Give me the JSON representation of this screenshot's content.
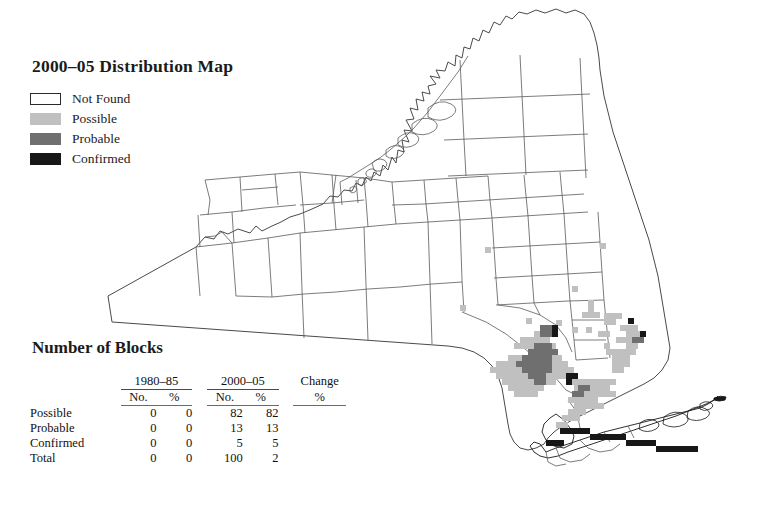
{
  "legend": {
    "title": "2000–05 Distribution Map",
    "items": [
      {
        "label": "Not Found",
        "swatch": "notfound",
        "color": "#ffffff"
      },
      {
        "label": "Possible",
        "swatch": "possible",
        "color": "#c0c0c0"
      },
      {
        "label": "Probable",
        "swatch": "probable",
        "color": "#6f6f6f"
      },
      {
        "label": "Confirmed",
        "swatch": "confirmed",
        "color": "#171717"
      }
    ]
  },
  "blocks": {
    "title": "Number of Blocks",
    "group_headers": [
      "1980–85",
      "2000–05",
      "Change"
    ],
    "sub_headers": [
      "No.",
      "%",
      "No.",
      "%",
      "%"
    ],
    "rows": [
      {
        "label": "Possible",
        "p1_no": "0",
        "p1_pct": "0",
        "p2_no": "82",
        "p2_pct": "82",
        "change_pct": ""
      },
      {
        "label": "Probable",
        "p1_no": "0",
        "p1_pct": "0",
        "p2_no": "13",
        "p2_pct": "13",
        "change_pct": ""
      },
      {
        "label": "Confirmed",
        "p1_no": "0",
        "p1_pct": "0",
        "p2_no": "5",
        "p2_pct": "5",
        "change_pct": ""
      },
      {
        "label": "Total",
        "p1_no": "0",
        "p1_pct": "0",
        "p2_no": "100",
        "p2_pct": "2",
        "change_pct": ""
      }
    ]
  },
  "map": {
    "region_name": "New York State county map",
    "outline_color": "#4a4a4a",
    "coast_color": "#1a1a1a",
    "block_size": 6,
    "blocks_possible": [
      [
        485,
        247
      ],
      [
        600,
        243
      ],
      [
        460,
        305
      ],
      [
        572,
        286
      ],
      [
        526,
        318
      ],
      [
        556,
        320
      ],
      [
        534,
        331
      ],
      [
        540,
        331
      ],
      [
        546,
        331
      ],
      [
        552,
        331
      ],
      [
        572,
        327
      ],
      [
        586,
        327
      ],
      [
        588,
        300
      ],
      [
        588,
        306
      ],
      [
        588,
        312
      ],
      [
        582,
        312
      ],
      [
        594,
        312
      ],
      [
        604,
        313
      ],
      [
        610,
        313
      ],
      [
        616,
        313
      ],
      [
        604,
        319
      ],
      [
        610,
        319
      ],
      [
        598,
        331
      ],
      [
        604,
        331
      ],
      [
        616,
        337
      ],
      [
        604,
        343
      ],
      [
        520,
        337
      ],
      [
        526,
        337
      ],
      [
        532,
        337
      ],
      [
        538,
        337
      ],
      [
        544,
        337
      ],
      [
        514,
        343
      ],
      [
        520,
        343
      ],
      [
        526,
        343
      ],
      [
        532,
        343
      ],
      [
        538,
        343
      ],
      [
        544,
        343
      ],
      [
        550,
        343
      ],
      [
        508,
        355
      ],
      [
        514,
        355
      ],
      [
        520,
        355
      ],
      [
        526,
        355
      ],
      [
        532,
        355
      ],
      [
        538,
        355
      ],
      [
        544,
        355
      ],
      [
        550,
        355
      ],
      [
        556,
        355
      ],
      [
        496,
        361
      ],
      [
        502,
        361
      ],
      [
        508,
        361
      ],
      [
        514,
        361
      ],
      [
        520,
        361
      ],
      [
        526,
        361
      ],
      [
        532,
        361
      ],
      [
        538,
        361
      ],
      [
        544,
        361
      ],
      [
        550,
        361
      ],
      [
        556,
        361
      ],
      [
        562,
        361
      ],
      [
        490,
        367
      ],
      [
        496,
        367
      ],
      [
        502,
        367
      ],
      [
        508,
        367
      ],
      [
        514,
        367
      ],
      [
        520,
        367
      ],
      [
        526,
        367
      ],
      [
        532,
        367
      ],
      [
        538,
        367
      ],
      [
        544,
        367
      ],
      [
        550,
        367
      ],
      [
        556,
        367
      ],
      [
        562,
        367
      ],
      [
        568,
        367
      ],
      [
        496,
        373
      ],
      [
        502,
        373
      ],
      [
        508,
        373
      ],
      [
        514,
        373
      ],
      [
        520,
        373
      ],
      [
        526,
        373
      ],
      [
        532,
        373
      ],
      [
        538,
        373
      ],
      [
        544,
        373
      ],
      [
        550,
        373
      ],
      [
        556,
        373
      ],
      [
        562,
        373
      ],
      [
        502,
        379
      ],
      [
        508,
        379
      ],
      [
        514,
        379
      ],
      [
        520,
        379
      ],
      [
        526,
        379
      ],
      [
        532,
        379
      ],
      [
        538,
        379
      ],
      [
        544,
        379
      ],
      [
        550,
        379
      ],
      [
        508,
        385
      ],
      [
        514,
        385
      ],
      [
        520,
        385
      ],
      [
        526,
        385
      ],
      [
        532,
        385
      ],
      [
        538,
        385
      ],
      [
        514,
        391
      ],
      [
        520,
        391
      ],
      [
        526,
        391
      ],
      [
        532,
        391
      ],
      [
        568,
        379
      ],
      [
        574,
        379
      ],
      [
        580,
        379
      ],
      [
        586,
        379
      ],
      [
        592,
        379
      ],
      [
        598,
        379
      ],
      [
        604,
        379
      ],
      [
        610,
        379
      ],
      [
        574,
        385
      ],
      [
        580,
        385
      ],
      [
        586,
        385
      ],
      [
        592,
        385
      ],
      [
        598,
        385
      ],
      [
        604,
        385
      ],
      [
        580,
        391
      ],
      [
        586,
        391
      ],
      [
        592,
        391
      ],
      [
        598,
        391
      ],
      [
        604,
        391
      ],
      [
        610,
        391
      ],
      [
        568,
        397
      ],
      [
        574,
        397
      ],
      [
        580,
        397
      ],
      [
        586,
        397
      ],
      [
        592,
        397
      ],
      [
        574,
        403
      ],
      [
        580,
        403
      ],
      [
        586,
        403
      ],
      [
        592,
        403
      ],
      [
        598,
        403
      ],
      [
        568,
        409
      ],
      [
        574,
        409
      ],
      [
        580,
        409
      ],
      [
        562,
        415
      ],
      [
        568,
        415
      ],
      [
        574,
        415
      ],
      [
        612,
        361
      ],
      [
        618,
        361
      ],
      [
        624,
        361
      ],
      [
        612,
        367
      ],
      [
        618,
        367
      ],
      [
        606,
        349
      ],
      [
        612,
        349
      ],
      [
        618,
        349
      ],
      [
        624,
        349
      ],
      [
        630,
        349
      ],
      [
        612,
        355
      ],
      [
        618,
        355
      ],
      [
        624,
        355
      ],
      [
        620,
        325
      ],
      [
        626,
        325
      ],
      [
        632,
        325
      ],
      [
        626,
        331
      ],
      [
        632,
        331
      ],
      [
        638,
        331
      ],
      [
        620,
        337
      ],
      [
        626,
        337
      ],
      [
        632,
        337
      ],
      [
        626,
        343
      ],
      [
        632,
        343
      ],
      [
        556,
        422
      ],
      [
        562,
        422
      ]
    ],
    "blocks_probable": [
      [
        540,
        325
      ],
      [
        546,
        325
      ],
      [
        540,
        331
      ],
      [
        546,
        331
      ],
      [
        534,
        343
      ],
      [
        540,
        343
      ],
      [
        546,
        343
      ],
      [
        528,
        349
      ],
      [
        534,
        349
      ],
      [
        540,
        349
      ],
      [
        546,
        349
      ],
      [
        552,
        349
      ],
      [
        522,
        355
      ],
      [
        528,
        355
      ],
      [
        534,
        355
      ],
      [
        540,
        355
      ],
      [
        546,
        355
      ],
      [
        516,
        361
      ],
      [
        522,
        361
      ],
      [
        528,
        361
      ],
      [
        534,
        361
      ],
      [
        540,
        361
      ],
      [
        546,
        361
      ],
      [
        522,
        367
      ],
      [
        528,
        367
      ],
      [
        534,
        367
      ],
      [
        540,
        367
      ],
      [
        546,
        367
      ],
      [
        528,
        373
      ],
      [
        534,
        373
      ],
      [
        540,
        373
      ],
      [
        534,
        379
      ],
      [
        540,
        379
      ],
      [
        632,
        337
      ],
      [
        638,
        337
      ],
      [
        578,
        385
      ],
      [
        584,
        385
      ],
      [
        572,
        391
      ],
      [
        578,
        391
      ]
    ],
    "blocks_confirmed": [
      [
        552,
        325
      ],
      [
        552,
        331
      ],
      [
        628,
        318
      ],
      [
        640,
        331
      ],
      [
        566,
        373
      ],
      [
        572,
        373
      ],
      [
        566,
        379
      ],
      [
        560,
        428
      ],
      [
        566,
        428
      ],
      [
        572,
        428
      ],
      [
        578,
        428
      ],
      [
        584,
        428
      ],
      [
        590,
        434
      ],
      [
        596,
        434
      ],
      [
        602,
        434
      ],
      [
        608,
        434
      ],
      [
        614,
        434
      ],
      [
        620,
        434
      ],
      [
        626,
        440
      ],
      [
        632,
        440
      ],
      [
        638,
        440
      ],
      [
        644,
        440
      ],
      [
        650,
        440
      ],
      [
        656,
        446
      ],
      [
        662,
        446
      ],
      [
        668,
        446
      ],
      [
        674,
        446
      ],
      [
        680,
        446
      ],
      [
        686,
        446
      ],
      [
        692,
        446
      ],
      [
        546,
        440
      ],
      [
        552,
        440
      ],
      [
        558,
        440
      ]
    ]
  }
}
